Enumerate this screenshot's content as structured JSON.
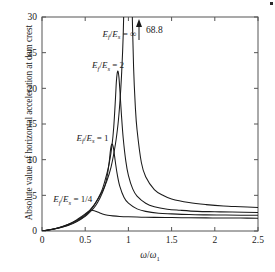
{
  "figure": {
    "background": "#ffffff",
    "line_color": "#1a1a1a",
    "ylabel": "Absolute value of horizontal acceleration at dam crest",
    "xlabel_num": "ω",
    "xlabel_den": "ω",
    "xlabel_den_sub": "1",
    "annotation": "68.8"
  },
  "chart_data": {
    "type": "line",
    "title": "",
    "xlabel": "ω/ω₁",
    "ylabel": "Absolute value of horizontal acceleration at dam crest",
    "xlim": [
      0,
      2.5
    ],
    "ylim": [
      0,
      30
    ],
    "xticks": [
      0,
      0.5,
      1,
      1.5,
      2,
      2.5
    ],
    "xticklabels": [
      "0",
      "0.5",
      "1",
      "1.5",
      "2",
      "2.5"
    ],
    "yticks": [
      0,
      5,
      10,
      15,
      20,
      25,
      30
    ],
    "yticklabels": [
      "0",
      "5",
      "10",
      "15",
      "20",
      "25",
      "30"
    ],
    "grid": false,
    "legend_position": "inline-annotations",
    "annotations": [
      {
        "text": "68.8",
        "x": 1.13,
        "y": 28.2,
        "arrow": "up",
        "note": "peak value of the E_f/E_s = ∞ curve, off the top of the axis"
      }
    ],
    "series": [
      {
        "name": "E_f/E_s = ∞",
        "label_tex": "E_f/E_s = ∞",
        "label_x": 0.7,
        "label_y": 27.2,
        "peak_x": 1.0,
        "peak_y": 68.8,
        "tail_value_at_2_5": 3.3,
        "x": [
          0.0,
          0.1,
          0.2,
          0.3,
          0.4,
          0.5,
          0.6,
          0.7,
          0.75,
          0.8,
          0.85,
          0.88,
          0.9,
          0.92,
          0.94,
          0.96,
          0.97,
          0.98,
          0.99,
          1.0,
          1.01,
          1.02,
          1.03,
          1.04,
          1.06,
          1.08,
          1.1,
          1.15,
          1.2,
          1.3,
          1.4,
          1.5,
          1.7,
          1.9,
          2.1,
          2.3,
          2.5
        ],
        "y": [
          0.0,
          0.22,
          0.5,
          0.9,
          1.45,
          2.3,
          3.6,
          5.6,
          7.0,
          9.0,
          12.2,
          15.0,
          17.8,
          21.7,
          27.5,
          38.0,
          46.0,
          56.0,
          65.0,
          68.8,
          62.0,
          51.0,
          41.0,
          33.0,
          23.0,
          17.5,
          14.2,
          9.6,
          7.6,
          5.8,
          5.0,
          4.5,
          4.0,
          3.7,
          3.5,
          3.4,
          3.3
        ]
      },
      {
        "name": "E_f/E_s = 2",
        "label_tex": "E_f/E_s = 2",
        "label_x": 0.58,
        "label_y": 22.8,
        "peak_x": 0.88,
        "peak_y": 22.4,
        "tail_value_at_2_5": 2.6,
        "x": [
          0.0,
          0.1,
          0.2,
          0.3,
          0.4,
          0.5,
          0.58,
          0.65,
          0.7,
          0.75,
          0.78,
          0.81,
          0.83,
          0.85,
          0.86,
          0.87,
          0.88,
          0.89,
          0.9,
          0.92,
          0.94,
          0.97,
          1.0,
          1.05,
          1.1,
          1.2,
          1.3,
          1.45,
          1.6,
          1.8,
          2.0,
          2.2,
          2.5
        ],
        "y": [
          0.0,
          0.2,
          0.45,
          0.82,
          1.35,
          2.15,
          3.2,
          4.6,
          5.9,
          8.0,
          9.6,
          12.0,
          14.5,
          18.5,
          20.8,
          22.1,
          22.4,
          21.6,
          20.0,
          16.2,
          13.0,
          9.8,
          7.8,
          5.9,
          4.9,
          3.9,
          3.4,
          3.05,
          2.9,
          2.75,
          2.7,
          2.65,
          2.6
        ]
      },
      {
        "name": "E_f/E_s = 1",
        "label_tex": "E_f/E_s = 1",
        "label_x": 0.4,
        "label_y": 12.6,
        "peak_x": 0.81,
        "peak_y": 12.2,
        "tail_value_at_2_5": 2.2,
        "x": [
          0.0,
          0.1,
          0.2,
          0.3,
          0.4,
          0.5,
          0.56,
          0.62,
          0.67,
          0.71,
          0.74,
          0.76,
          0.78,
          0.79,
          0.8,
          0.81,
          0.82,
          0.83,
          0.85,
          0.87,
          0.9,
          0.95,
          1.0,
          1.1,
          1.2,
          1.35,
          1.5,
          1.7,
          1.9,
          2.1,
          2.3,
          2.5
        ],
        "y": [
          0.0,
          0.18,
          0.42,
          0.78,
          1.28,
          2.05,
          2.7,
          3.55,
          4.6,
          5.7,
          6.9,
          8.1,
          9.9,
          11.1,
          11.9,
          12.2,
          12.0,
          11.4,
          9.6,
          8.0,
          6.3,
          4.7,
          3.9,
          3.1,
          2.75,
          2.5,
          2.4,
          2.3,
          2.26,
          2.24,
          2.22,
          2.2
        ]
      },
      {
        "name": "E_f/E_s = 1/4",
        "label_tex": "E_f/E_s = 1/4",
        "label_x": 0.13,
        "label_y": 4.0,
        "peak_x": 0.57,
        "peak_y": 2.9,
        "tail_value_at_2_5": 1.8,
        "x": [
          0.0,
          0.08,
          0.16,
          0.24,
          0.32,
          0.4,
          0.46,
          0.5,
          0.53,
          0.55,
          0.57,
          0.59,
          0.62,
          0.66,
          0.7,
          0.76,
          0.82,
          0.9,
          1.0,
          1.15,
          1.3,
          1.5,
          1.7,
          1.9,
          2.1,
          2.3,
          2.5
        ],
        "y": [
          0.0,
          0.16,
          0.36,
          0.64,
          1.02,
          1.55,
          2.05,
          2.4,
          2.68,
          2.82,
          2.9,
          2.88,
          2.78,
          2.58,
          2.4,
          2.22,
          2.12,
          2.04,
          1.99,
          1.94,
          1.91,
          1.88,
          1.86,
          1.84,
          1.82,
          1.81,
          1.8
        ]
      }
    ]
  }
}
